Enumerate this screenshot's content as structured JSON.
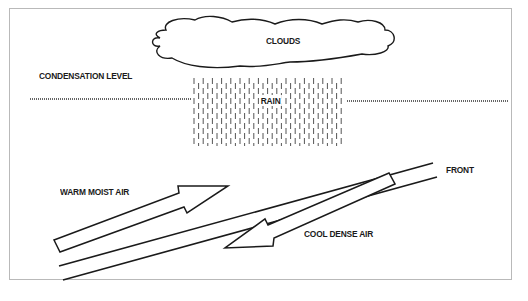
{
  "diagram": {
    "labels": {
      "clouds": "CLOUDS",
      "condensation_level": "CONDENSATION LEVEL",
      "rain": "RAIN",
      "front": "FRONT",
      "warm_air": "WARM MOIST AIR",
      "cool_air": "COOL DENSE AIR"
    },
    "colors": {
      "stroke": "#1a1a1a",
      "rain": "#555555",
      "border": "#b9b9b9",
      "background": "#ffffff"
    },
    "elements": [
      {
        "id": "clouds",
        "shape": "cloud outline"
      },
      {
        "id": "condensation-level",
        "shape": "dotted horizontal line"
      },
      {
        "id": "rain",
        "shape": "field of vertical dashes"
      },
      {
        "id": "front",
        "shape": "two parallel sloped lines"
      },
      {
        "id": "warm-air-arrow",
        "shape": "hollow arrow pointing up-right"
      },
      {
        "id": "cool-air-arrow",
        "shape": "hollow arrow pointing down-left"
      }
    ]
  }
}
